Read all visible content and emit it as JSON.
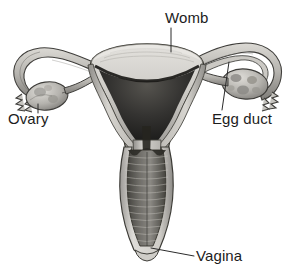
{
  "figure": {
    "style": "grayscale pencil anatomical illustration, cut-away view",
    "background_color": "#ffffff",
    "width": 294,
    "height": 274
  },
  "labels": [
    {
      "id": "womb",
      "text": "Womb",
      "position": "top-center",
      "leader_line": "vertical line from label down to the fundus of the uterus"
    },
    {
      "id": "ovary",
      "text": "Ovary",
      "position": "left",
      "leader_line": "short vertical line from label up to the left ovary"
    },
    {
      "id": "egg_duct",
      "text": "Egg duct",
      "position": "right",
      "leader_line": "slightly slanted line from label up to the right fallopian tube"
    },
    {
      "id": "vagina",
      "text": "Vagina",
      "position": "bottom-right",
      "leader_line": "diagonal line from label left-up to the lower vaginal canal"
    }
  ],
  "colors": {
    "ink": "#1c1c1c",
    "leader_line": "#2b2b2b",
    "tissue_light": "#d8d6d2",
    "tissue_mid": "#a8a6a2",
    "tissue_shadow": "#6e6c69",
    "cavity_dark": "#2e2d2c",
    "cavity_deep": "#151514",
    "outline": "#3a3936",
    "background": "#ffffff"
  },
  "structures": [
    {
      "name": "uterus-fundus",
      "description": "domed top of the womb, light shaded"
    },
    {
      "name": "uterine-cavity",
      "description": "dark triangular inner cavity of the womb"
    },
    {
      "name": "uterine-wall",
      "description": "thick pale muscular walls on both sides"
    },
    {
      "name": "cervix",
      "description": "narrow neck between womb and vagina"
    },
    {
      "name": "vaginal-canal",
      "description": "long canal with horizontal rugae ridges"
    },
    {
      "name": "left-fallopian-tube",
      "description": "tube curving up and around to the left"
    },
    {
      "name": "right-fallopian-tube",
      "description": "tube curving up and around to the right, shown in cross-section"
    },
    {
      "name": "left-fimbriae",
      "description": "finger-like projections at the end of the left tube"
    },
    {
      "name": "right-fimbriae",
      "description": "finger-like projections at the end of the right tube"
    },
    {
      "name": "left-ovary",
      "description": "lobed oval body below the left tube"
    },
    {
      "name": "right-ovary",
      "description": "oval body with visible follicles below the right tube"
    }
  ]
}
